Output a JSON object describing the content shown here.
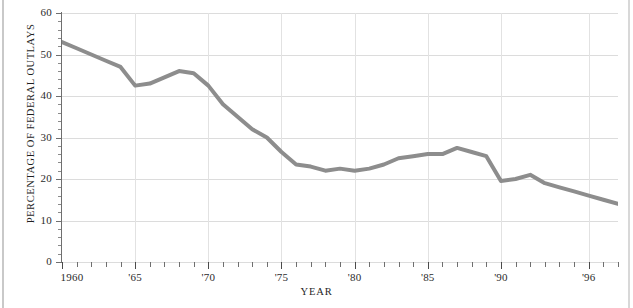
{
  "chart_data": {
    "type": "line",
    "title": "",
    "xlabel": "YEAR",
    "ylabel": "PERCENTAGE OF FEDERAL OUTLAYS",
    "xlim": [
      1960,
      1998
    ],
    "ylim": [
      0,
      60
    ],
    "grid": "both",
    "legend": "none",
    "line_color": "#8d8d8d",
    "line_width": 4,
    "x": [
      1960,
      1961,
      1962,
      1963,
      1964,
      1965,
      1966,
      1967,
      1968,
      1969,
      1970,
      1971,
      1972,
      1973,
      1974,
      1975,
      1976,
      1977,
      1978,
      1979,
      1980,
      1981,
      1982,
      1983,
      1984,
      1985,
      1986,
      1987,
      1988,
      1989,
      1990,
      1991,
      1992,
      1993,
      1994,
      1995,
      1996,
      1997,
      1998
    ],
    "values": [
      53.0,
      51.5,
      50.0,
      48.5,
      47.0,
      42.5,
      43.0,
      44.5,
      46.0,
      45.5,
      42.5,
      38.0,
      35.0,
      32.0,
      30.0,
      26.5,
      23.5,
      23.0,
      22.0,
      22.5,
      22.0,
      22.5,
      23.5,
      25.0,
      25.5,
      26.0,
      26.0,
      27.5,
      26.5,
      25.5,
      19.5,
      20.0,
      21.0,
      19.0,
      18.0,
      17.0,
      16.0,
      15.0,
      14.0
    ],
    "y_ticks": [
      0,
      10,
      20,
      30,
      40,
      50,
      60
    ],
    "y_tick_labels": [
      "0",
      "10",
      "20",
      "30",
      "40",
      "50",
      "60"
    ],
    "x_ticks": [
      1960,
      1965,
      1970,
      1975,
      1980,
      1985,
      1990,
      1996
    ],
    "x_tick_labels": [
      "1960",
      "'65",
      "'70",
      "'75",
      "'80",
      "'85",
      "'90",
      "'96"
    ],
    "x_minor_tick_step": 1,
    "y_minor_tick_step": 2
  }
}
